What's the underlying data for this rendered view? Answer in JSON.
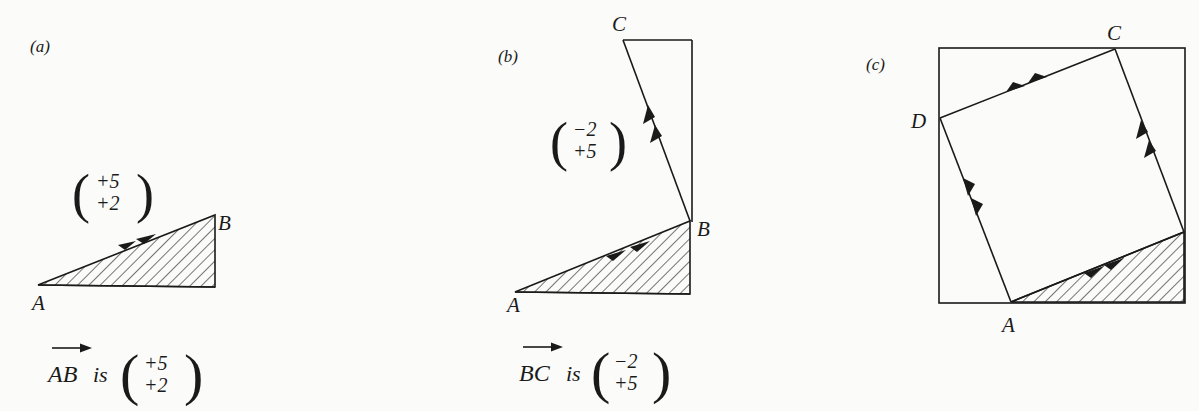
{
  "panels": [
    {
      "id": "a",
      "label": "(a)",
      "points": {
        "A": "A",
        "B": "B"
      },
      "vector_label": {
        "top": "+5",
        "bottom": "+2"
      },
      "caption": {
        "vector_name": "AB",
        "is_word": "is",
        "top": "+5",
        "bottom": "+2"
      }
    },
    {
      "id": "b",
      "label": "(b)",
      "points": {
        "A": "A",
        "B": "B",
        "C": "C"
      },
      "vector_label": {
        "top": "−2",
        "bottom": "+5"
      },
      "caption": {
        "vector_name": "BC",
        "is_word": "is",
        "top": "−2",
        "bottom": "+5"
      }
    },
    {
      "id": "c",
      "label": "(c)",
      "points": {
        "A": "A",
        "C": "C",
        "D": "D"
      }
    }
  ],
  "colors": {
    "ink": "#1a1a1a",
    "paper": "#fbfbf9"
  }
}
